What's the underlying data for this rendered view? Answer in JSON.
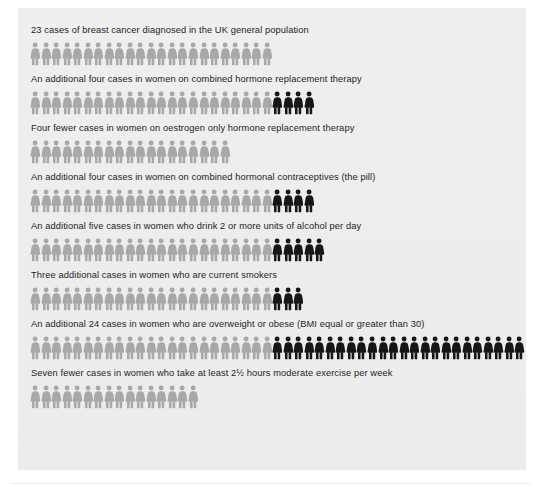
{
  "figure": {
    "base_color": "#a8a8a8",
    "extra_color": "#161616",
    "panel_color": "#ededed",
    "icon_name": "woman-figure-icon"
  },
  "chart_data": {
    "type": "bar",
    "xlabel": "",
    "ylabel": "",
    "unit": "cases",
    "baseline": 23,
    "categories": [
      "UK general population",
      "Combined hormone replacement therapy",
      "Oestrogen only hormone replacement therapy",
      "Combined hormonal contraceptives (the pill)",
      "Drink 2 or more units of alcohol per day",
      "Current smokers",
      "Overweight or obese (BMI equal or greater than 30)",
      "At least 2½ hours moderate exercise per week"
    ],
    "values": [
      23,
      27,
      19,
      27,
      28,
      26,
      47,
      16
    ],
    "series": [
      {
        "name": "Baseline cases",
        "values": [
          23,
          23,
          19,
          23,
          23,
          23,
          23,
          16
        ]
      },
      {
        "name": "Additional cases",
        "values": [
          0,
          4,
          0,
          4,
          5,
          3,
          24,
          0
        ]
      }
    ],
    "deltas": [
      0,
      4,
      -4,
      4,
      5,
      3,
      24,
      -7
    ]
  },
  "rows": [
    {
      "caption": "23 cases of breast cancer diagnosed in the UK general population",
      "base": 23,
      "extra": 0
    },
    {
      "caption": "An additional four cases in women on combined hormone replacement therapy",
      "base": 23,
      "extra": 4
    },
    {
      "caption": "Four fewer cases in women on oestrogen only hormone replacement therapy",
      "base": 19,
      "extra": 0
    },
    {
      "caption": "An additional four cases in women on combined hormonal contraceptives (the pill)",
      "base": 23,
      "extra": 4
    },
    {
      "caption": "An additional five cases in women who drink 2 or more units of alcohol per day",
      "base": 23,
      "extra": 5
    },
    {
      "caption": "Three additional cases in women who are current smokers",
      "base": 23,
      "extra": 3
    },
    {
      "caption": "An additional 24 cases in women who are overweight or obese (BMI equal or greater than 30)",
      "base": 23,
      "extra": 24
    },
    {
      "caption": "Seven fewer cases in women who take at least 2½ hours moderate exercise per week",
      "base": 16,
      "extra": 0
    }
  ]
}
